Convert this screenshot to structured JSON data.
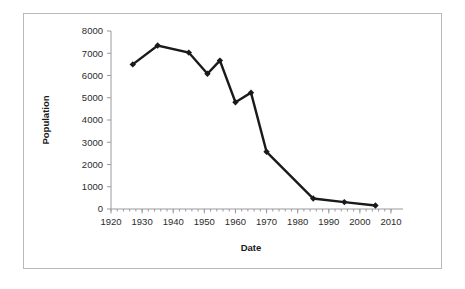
{
  "chart_data": {
    "type": "line",
    "title": "",
    "xlabel": "Date",
    "ylabel": "Population",
    "xlim": [
      1920,
      2010
    ],
    "ylim": [
      0,
      8000
    ],
    "grid": false,
    "legend": "none",
    "x_ticks": [
      1920,
      1930,
      1940,
      1950,
      1960,
      1970,
      1980,
      1990,
      2000,
      2010
    ],
    "x_tick_labels": [
      "1920",
      "1930",
      "1940",
      "1950",
      "1960",
      "1970",
      "1980",
      "1990",
      "2000",
      "2010"
    ],
    "y_ticks": [
      0,
      1000,
      2000,
      3000,
      4000,
      5000,
      6000,
      7000,
      8000
    ],
    "y_tick_labels": [
      "0",
      "1000",
      "2000",
      "3000",
      "4000",
      "5000",
      "6000",
      "7000",
      "8000"
    ],
    "series": [
      {
        "name": "Population",
        "marker": "diamond",
        "color": "#1a1a1a",
        "x": [
          1927,
          1935,
          1945,
          1951,
          1955,
          1960,
          1965,
          1970,
          1985,
          1995,
          2005
        ],
        "values": [
          6500,
          7350,
          7030,
          6080,
          6670,
          4800,
          5230,
          2570,
          470,
          310,
          160
        ]
      }
    ]
  }
}
